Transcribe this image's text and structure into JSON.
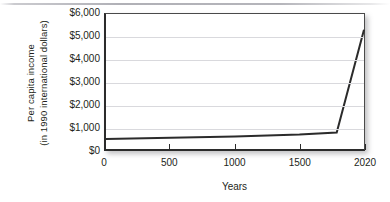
{
  "figure": {
    "name": "per-capita-income-over-time"
  },
  "chart_data": {
    "type": "line",
    "title": "",
    "xlabel": "Years",
    "ylabel_lines": [
      "Per capita income",
      "(in 1990 international dollars)"
    ],
    "ylabel": "Per capita income (in 1990 international dollars)",
    "x_tick_labels": [
      "0",
      "500",
      "1000",
      "1500",
      "2020"
    ],
    "x_tick_values": [
      0,
      500,
      1000,
      1500,
      2020
    ],
    "y_tick_labels": [
      "$0",
      "$1,000",
      "$2,000",
      "$3,000",
      "$4,000",
      "$5,000",
      "$6,000"
    ],
    "y_tick_values": [
      0,
      1000,
      2000,
      3000,
      4000,
      5000,
      6000
    ],
    "ylim": [
      0,
      6000
    ],
    "xlim": [
      0,
      2020
    ],
    "grid": "horizontal",
    "legend": "none",
    "series": [
      {
        "name": "Per capita income",
        "color": "#2b2b2b",
        "x": [
          0,
          1000,
          1500,
          1800,
          2020
        ],
        "values": [
          440,
          560,
          640,
          730,
          5300
        ]
      }
    ]
  }
}
